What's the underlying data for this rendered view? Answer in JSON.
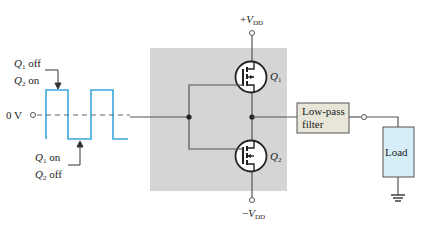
{
  "diagram": {
    "colors": {
      "wire": "#555555",
      "signal": "#3aa7dd",
      "shaded_block": "#d5d5d5",
      "filter_fill": "#e7e6d9",
      "load_fill": "#d6eef7",
      "text": "#222222"
    },
    "supply_top": {
      "sign": "+",
      "symbol": "V",
      "subscript": "DD"
    },
    "supply_bottom": {
      "sign": "−",
      "symbol": "V",
      "subscript": "DD"
    },
    "transistors": [
      {
        "id": "Q1",
        "symbol": "Q",
        "subscript": "1"
      },
      {
        "id": "Q2",
        "symbol": "Q",
        "subscript": "2"
      }
    ],
    "input_reference": "0 V",
    "annotations": {
      "top": {
        "line1_q": "Q",
        "line1_sub": "1",
        "line1_state": " off",
        "line2_q": "Q",
        "line2_sub": "2",
        "line2_state": " on"
      },
      "bottom": {
        "line1_q": "Q",
        "line1_sub": "1",
        "line1_state": " on",
        "line2_q": "Q",
        "line2_sub": "2",
        "line2_state": " off"
      }
    },
    "filter": {
      "line1": "Low-pass",
      "line2": "filter"
    },
    "load": {
      "label": "Load"
    }
  }
}
